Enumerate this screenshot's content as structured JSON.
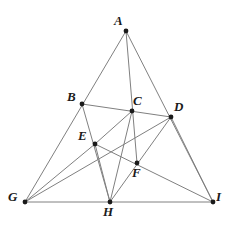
{
  "figure": {
    "width": 232,
    "height": 229,
    "background_color": "#ffffff",
    "line_color": "#808080",
    "line_width": 1,
    "point_color": "#1a1a1a",
    "point_radius": 2.4,
    "label_color": "#1a1a1a"
  },
  "points": [
    {
      "id": "A",
      "label": "A",
      "x": 126,
      "y": 31,
      "label_x": 114,
      "label_y": 14
    },
    {
      "id": "B",
      "label": "B",
      "x": 82,
      "y": 104,
      "label_x": 67,
      "label_y": 90
    },
    {
      "id": "C",
      "label": "C",
      "x": 132,
      "y": 111,
      "label_x": 133,
      "label_y": 94
    },
    {
      "id": "D",
      "label": "D",
      "x": 171,
      "y": 117,
      "label_x": 174,
      "label_y": 100
    },
    {
      "id": "E",
      "label": "E",
      "x": 95,
      "y": 144,
      "label_x": 78,
      "label_y": 129
    },
    {
      "id": "F",
      "label": "F",
      "x": 137,
      "y": 163,
      "label_x": 132,
      "label_y": 166
    },
    {
      "id": "G",
      "label": "G",
      "x": 25,
      "y": 202,
      "label_x": 8,
      "label_y": 190
    },
    {
      "id": "H",
      "label": "H",
      "x": 110,
      "y": 202,
      "label_x": 103,
      "label_y": 205
    },
    {
      "id": "I",
      "label": "I",
      "x": 213,
      "y": 202,
      "label_x": 216,
      "label_y": 190
    }
  ],
  "segments": [
    {
      "from": "A",
      "to": "G",
      "name": "segment-A-G"
    },
    {
      "from": "A",
      "to": "I",
      "name": "segment-A-I"
    },
    {
      "from": "G",
      "to": "I",
      "name": "segment-G-I"
    },
    {
      "from": "A",
      "to": "F",
      "name": "segment-A-F"
    },
    {
      "from": "B",
      "to": "D",
      "name": "segment-B-D"
    },
    {
      "from": "B",
      "to": "H",
      "name": "segment-B-H"
    },
    {
      "from": "G",
      "to": "D",
      "name": "segment-G-D"
    },
    {
      "from": "G",
      "to": "E",
      "name": "segment-G-E"
    },
    {
      "from": "E",
      "to": "I",
      "name": "segment-E-I"
    },
    {
      "from": "E",
      "to": "H",
      "name": "segment-E-H"
    },
    {
      "from": "D",
      "to": "H",
      "name": "segment-D-H"
    },
    {
      "from": "D",
      "to": "I",
      "name": "segment-D-I"
    },
    {
      "from": "C",
      "to": "E",
      "name": "segment-C-E"
    },
    {
      "from": "C",
      "to": "H",
      "name": "segment-C-H"
    }
  ]
}
